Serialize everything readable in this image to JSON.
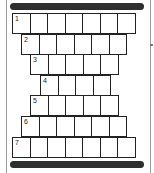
{
  "puzzle": {
    "rows": [
      {
        "number": "1",
        "cells": 7,
        "left": 12,
        "top": 13
      },
      {
        "number": "2",
        "cells": 6,
        "left": 21,
        "top": 34
      },
      {
        "number": "3",
        "cells": 5,
        "left": 30,
        "top": 54
      },
      {
        "number": "4",
        "cells": 4,
        "left": 40,
        "top": 75
      },
      {
        "number": "5",
        "cells": 5,
        "left": 30,
        "top": 95
      },
      {
        "number": "6",
        "cells": 6,
        "left": 21,
        "top": 116
      },
      {
        "number": "7",
        "cells": 7,
        "left": 12,
        "top": 137
      }
    ]
  },
  "colors": {
    "bar": "#2e2e2e",
    "grid_line": "#222222",
    "frame": "#9a9a9a"
  }
}
